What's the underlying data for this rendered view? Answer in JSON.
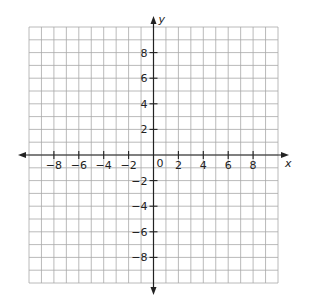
{
  "chart_data": {
    "type": "scatter",
    "title": "",
    "xlabel": "x",
    "ylabel": "y",
    "xlim": [
      -10,
      10
    ],
    "ylim": [
      -10,
      10
    ],
    "grid": true,
    "grid_step": 1,
    "x_ticks": [
      -8,
      -6,
      -4,
      -2,
      2,
      4,
      6,
      8
    ],
    "y_ticks": [
      8,
      6,
      4,
      2,
      -2,
      -4,
      -6,
      -8
    ],
    "x_tick_labels": [
      "−8",
      "−6",
      "−4",
      "−2",
      "2",
      "4",
      "6",
      "8"
    ],
    "y_tick_labels": [
      "8",
      "6",
      "4",
      "2",
      "−2",
      "−4",
      "−6",
      "−8"
    ],
    "origin_label": "0",
    "series": [],
    "colors": {
      "grid": "#a8a8a8",
      "axis": "#222222"
    }
  }
}
